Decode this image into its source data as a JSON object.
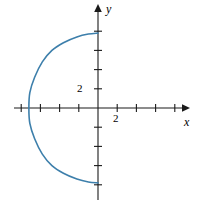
{
  "figure": {
    "name": "cartesian-plane-with-leftward-arc",
    "width": 200,
    "height": 203,
    "background_color": "#ffffff"
  },
  "axes": {
    "x": {
      "label": "x",
      "color": "#000000",
      "origin_px": 98,
      "start_px": 14,
      "end_px": 186,
      "tick_labels": [
        {
          "text": "2",
          "value": 2
        }
      ]
    },
    "y": {
      "label": "y",
      "color": "#000000",
      "origin_px": 108,
      "start_px": 200,
      "end_px": 8,
      "tick_labels": [
        {
          "text": "2",
          "value": 2
        }
      ]
    },
    "tick_spacing_px": 19.2,
    "tick_length_px": 5,
    "arrowheads": [
      "x-positive",
      "y-positive"
    ]
  },
  "chart_data": {
    "type": "line",
    "title": "",
    "xlabel": "x",
    "ylabel": "y",
    "xlim": [
      -4.4,
      4.6
    ],
    "ylim": [
      -4.8,
      5.2
    ],
    "grid": false,
    "legend": null,
    "curve_color": "#3d7fab",
    "curve_width_px": 1.6,
    "series": [
      {
        "name": "arc",
        "x": [
          0.0,
          -0.5,
          -1.1,
          -1.8,
          -2.4,
          -2.9,
          -3.3,
          -3.55,
          -3.6,
          -3.55,
          -3.3,
          -2.9,
          -2.4,
          -1.8,
          -1.1,
          -0.5,
          0.0
        ],
        "y": [
          3.9,
          3.85,
          3.7,
          3.4,
          3.0,
          2.4,
          1.6,
          0.8,
          0.0,
          -0.8,
          -1.6,
          -2.4,
          -3.0,
          -3.4,
          -3.7,
          -3.85,
          -3.9
        ]
      }
    ],
    "endpoints": [
      {
        "label": "top",
        "x": 0.0,
        "y": 3.9
      },
      {
        "label": "leftmost",
        "x": -3.6,
        "y": 0.0
      },
      {
        "label": "bottom",
        "x": 0.0,
        "y": -3.9
      }
    ]
  }
}
